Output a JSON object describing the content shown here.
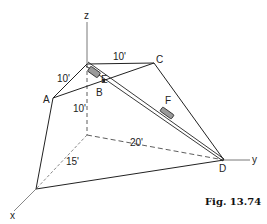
{
  "figure": {
    "caption": "Fig. 13.74",
    "axes": {
      "x": "x",
      "y": "y",
      "z": "z"
    },
    "points": {
      "A": "A",
      "B": "B",
      "C": "C",
      "D": "D",
      "E": "E",
      "F": "F"
    },
    "dimensions": {
      "top_to_A": "10'",
      "top_to_C": "10'",
      "vertical_height": "10'",
      "origin_to_D": "20'",
      "origin_to_x_point": "15'"
    },
    "colors": {
      "line": "#222222",
      "background": "#ffffff",
      "collar_fill": "#9a9a9a"
    }
  }
}
